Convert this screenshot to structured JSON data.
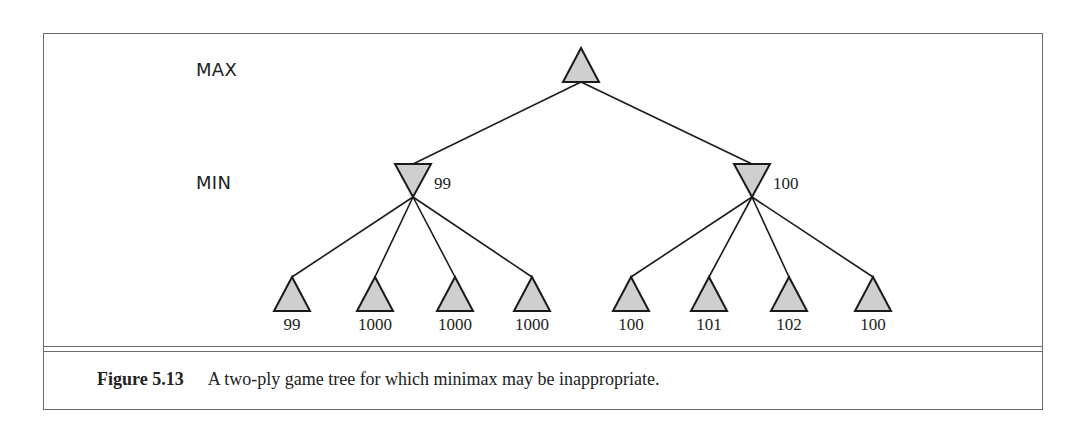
{
  "diagram": {
    "levels": [
      {
        "name": "max",
        "label": "MAX"
      },
      {
        "name": "min",
        "label": "MIN"
      }
    ],
    "root": {
      "type": "MAX",
      "x": 581
    },
    "min_nodes": [
      {
        "x": 413,
        "value": "99",
        "leaves": [
          {
            "x": 292,
            "value": "99"
          },
          {
            "x": 375,
            "value": "1000"
          },
          {
            "x": 455,
            "value": "1000"
          },
          {
            "x": 532,
            "value": "1000"
          }
        ]
      },
      {
        "x": 752,
        "value": "100",
        "leaves": [
          {
            "x": 631,
            "value": "100"
          },
          {
            "x": 709,
            "value": "101"
          },
          {
            "x": 789,
            "value": "102"
          },
          {
            "x": 873,
            "value": "100"
          }
        ]
      }
    ],
    "node_fill": "#cfcfcf",
    "line_color": "#1a1a1a"
  },
  "caption": {
    "number": "Figure 5.13",
    "text": "A two-ply game tree for which minimax may be inappropriate."
  }
}
